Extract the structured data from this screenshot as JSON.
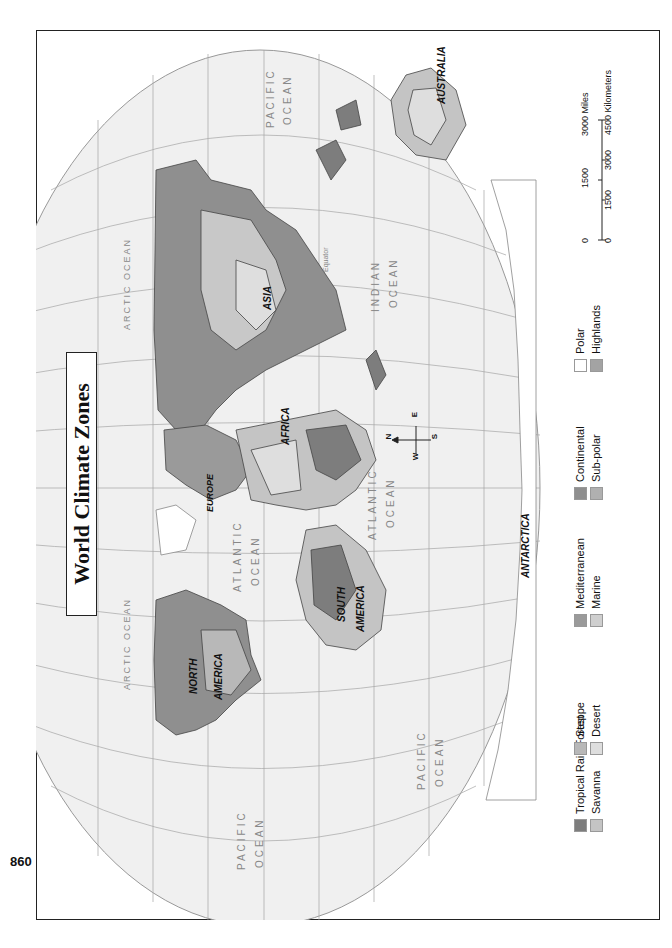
{
  "page": {
    "page_number": "860",
    "title": "World Climate Zones",
    "orientation": "rotated 90 degrees (landscape map on portrait page)"
  },
  "map": {
    "continents": [
      "NORTH AMERICA",
      "SOUTH AMERICA",
      "EUROPE",
      "AFRICA",
      "ASIA",
      "AUSTRALIA",
      "ANTARCTICA"
    ],
    "labels": {
      "north_america_1": "NORTH",
      "north_america_2": "AMERICA",
      "south_america_1": "SOUTH",
      "south_america_2": "AMERICA",
      "europe": "EUROPE",
      "africa": "AFRICA",
      "asia": "ASIA",
      "australia": "AUSTRALIA",
      "antarctica": "ANTARCTICA"
    },
    "oceans": {
      "pacific_west_1": "PACIFIC",
      "pacific_west_2": "OCEAN",
      "pacific_east_1": "PACIFIC",
      "pacific_east_2": "OCEAN",
      "pacific_top_1": "PACIFIC",
      "pacific_top_2": "OCEAN",
      "atlantic_north_1": "ATLANTIC",
      "atlantic_north_2": "OCEAN",
      "atlantic_south_1": "ATLANTIC",
      "atlantic_south_2": "OCEAN",
      "indian_1": "INDIAN",
      "indian_2": "OCEAN",
      "arctic_1": "ARCTIC OCEAN",
      "arctic_2": "ARCTIC OCEAN"
    },
    "equator_label": "Equator",
    "compass": {
      "n": "N",
      "s": "S",
      "e": "E",
      "w": "W"
    },
    "longitude_labels": [
      "180°",
      "160°",
      "140°",
      "120°",
      "100°",
      "80°",
      "60°",
      "40°",
      "20°",
      "0°",
      "20°",
      "40°",
      "60°",
      "80°",
      "100°",
      "120°",
      "140°",
      "160°",
      "180°"
    ],
    "latitude_labels": [
      "80°",
      "60°",
      "40°",
      "20°",
      "0°",
      "20°",
      "40°",
      "60°",
      "80°"
    ],
    "pole_labels": [
      "90°",
      "90°"
    ]
  },
  "legend": {
    "items": [
      {
        "label": "Tropical Rain Forest",
        "color": "#7d7d7d"
      },
      {
        "label": "Savanna",
        "color": "#c4c4c4"
      },
      {
        "label": "Steppe",
        "color": "#b8b8b8"
      },
      {
        "label": "Desert",
        "color": "#dedede"
      },
      {
        "label": "Mediterranean",
        "color": "#9a9a9a"
      },
      {
        "label": "Marine",
        "color": "#cfcfcf"
      },
      {
        "label": "Continental",
        "color": "#8f8f8f"
      },
      {
        "label": "Sub-polar",
        "color": "#b0b0b0"
      },
      {
        "label": "Polar",
        "color": "#ffffff"
      },
      {
        "label": "Highlands",
        "color": "#a3a3a3"
      }
    ]
  },
  "scale": {
    "miles_ticks": [
      "0",
      "1500",
      "3000 Miles"
    ],
    "km_ticks": [
      "0",
      "1500",
      "3000",
      "4500 Kilometers"
    ]
  },
  "colors": {
    "ocean": "#eeeeee",
    "graticule": "#9a9a9a",
    "border": "#222222",
    "land_dark": "#8a8a8a",
    "land_light": "#cccccc"
  }
}
